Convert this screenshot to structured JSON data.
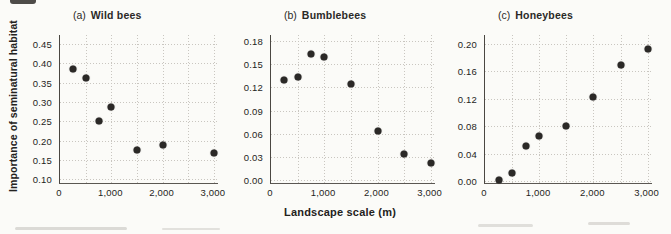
{
  "figure": {
    "y_axis_label": "Importance of seminatural habitat",
    "x_axis_label": "Landscape scale (m)"
  },
  "colors": {
    "background": "#fbfbf8",
    "point": "#2b2927",
    "grid": "#c9c6c0",
    "axis": "#4a4742"
  },
  "chart_data": [
    {
      "type": "scatter",
      "panel": "a",
      "title_prefix": "(a)",
      "title": "Wild bees",
      "x": [
        250,
        500,
        750,
        1000,
        1500,
        2000,
        3000
      ],
      "y": [
        0.385,
        0.362,
        0.25,
        0.288,
        0.175,
        0.188,
        0.168
      ],
      "xlim": [
        0,
        3080
      ],
      "ylim": [
        0.09,
        0.473
      ],
      "xticks": [
        0,
        1000,
        2000,
        3000
      ],
      "xtick_labels": [
        "0",
        "1,000",
        "2,000",
        "3,000"
      ],
      "yticks": [
        0.1,
        0.15,
        0.2,
        0.25,
        0.3,
        0.35,
        0.4,
        0.45
      ],
      "ytick_labels": [
        "0.10",
        "0.15",
        "0.20",
        "0.25",
        "0.30",
        "0.35",
        "0.40",
        "0.45"
      ],
      "xgrid": [
        500,
        1000,
        1500,
        2000,
        2500,
        3000
      ],
      "grid": "dotted",
      "legend": "none"
    },
    {
      "type": "scatter",
      "panel": "b",
      "title_prefix": "(b)",
      "title": "Bumblebees",
      "x": [
        250,
        500,
        750,
        1000,
        1500,
        2000,
        2500,
        3000
      ],
      "y": [
        0.13,
        0.134,
        0.164,
        0.16,
        0.125,
        0.063,
        0.034,
        0.022
      ],
      "xlim": [
        0,
        3080
      ],
      "ylim": [
        -0.004,
        0.188
      ],
      "xticks": [
        0,
        1000,
        2000,
        3000
      ],
      "xtick_labels": [
        "0",
        "1,000",
        "2,000",
        "3,000"
      ],
      "yticks": [
        0.0,
        0.03,
        0.06,
        0.09,
        0.12,
        0.15,
        0.18
      ],
      "ytick_labels": [
        "0.00",
        "0.03",
        "0.06",
        "0.09",
        "0.12",
        "0.15",
        "0.18"
      ],
      "xgrid": [
        500,
        1000,
        1500,
        2000,
        2500,
        3000
      ],
      "grid": "dotted",
      "legend": "none"
    },
    {
      "type": "scatter",
      "panel": "c",
      "title_prefix": "(c)",
      "title": "Honeybees",
      "x": [
        250,
        500,
        750,
        1000,
        1500,
        2000,
        2500,
        3000
      ],
      "y": [
        0.001,
        0.011,
        0.051,
        0.066,
        0.08,
        0.122,
        0.169,
        0.192
      ],
      "xlim": [
        0,
        3080
      ],
      "ylim": [
        -0.003,
        0.213
      ],
      "xticks": [
        0,
        1000,
        2000,
        3000
      ],
      "xtick_labels": [
        "0",
        "1,000",
        "2,000",
        "3,000"
      ],
      "yticks": [
        0.0,
        0.04,
        0.08,
        0.12,
        0.16,
        0.2
      ],
      "ytick_labels": [
        "0.00",
        "0.04",
        "0.08",
        "0.12",
        "0.16",
        "0.20"
      ],
      "xgrid": [
        500,
        1000,
        1500,
        2000,
        2500,
        3000
      ],
      "grid": "dotted",
      "legend": "none"
    }
  ]
}
